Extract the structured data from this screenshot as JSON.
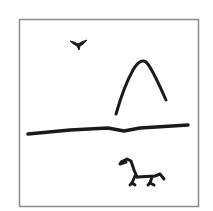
{
  "figure": {
    "elements": [
      {
        "name": "frame",
        "icon": "square-frame"
      },
      {
        "name": "bird",
        "icon": "bird-icon"
      },
      {
        "name": "mountain",
        "icon": "mountain-arch-icon"
      },
      {
        "name": "horizon",
        "icon": "horizon-line"
      },
      {
        "name": "animal",
        "icon": "animal-icon"
      }
    ],
    "colors": {
      "background": "#ffffff",
      "frame": "#8a8a8a",
      "ink": "#1a1a1a"
    }
  }
}
